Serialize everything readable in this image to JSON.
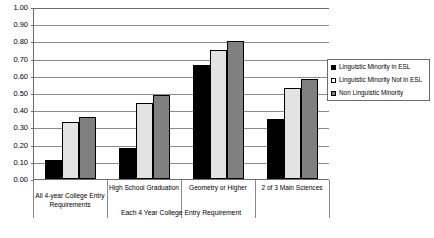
{
  "chart_data": {
    "type": "bar",
    "title": "",
    "xlabel": "Each 4 Year College Entry Requirement",
    "ylabel": "",
    "ylim": [
      0.0,
      1.0
    ],
    "grid": true,
    "legend_position": "right",
    "categories": [
      "All 4-year College Entry Requirements",
      "High School Graduation",
      "Geometry or Higher",
      "2 of 3 Main Sciences"
    ],
    "ytick_labels": [
      "1.00",
      "0.90",
      "0.80",
      "0.70",
      "0.60",
      "0.50",
      "0.40",
      "0.30",
      "0.20",
      "0.10",
      "0.00"
    ],
    "ytick_values": [
      1.0,
      0.9,
      0.8,
      0.7,
      0.6,
      0.5,
      0.4,
      0.3,
      0.2,
      0.1,
      0.0
    ],
    "series": [
      {
        "name": "Linguistic Minority in ESL",
        "color": "#000000",
        "values": [
          0.11,
          0.18,
          0.66,
          0.35
        ]
      },
      {
        "name": "Linguistic Minority Not in ESL",
        "color": "#e3e3e3",
        "values": [
          0.33,
          0.44,
          0.75,
          0.53
        ]
      },
      {
        "name": "Non Linguistic Minority",
        "color": "#808080",
        "values": [
          0.36,
          0.49,
          0.8,
          0.58
        ]
      }
    ]
  }
}
